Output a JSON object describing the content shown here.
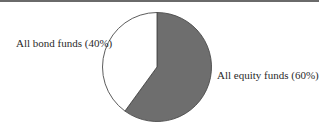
{
  "chart_data": {
    "type": "pie",
    "title": "",
    "categories": [
      "All bond funds",
      "All equity funds"
    ],
    "values": [
      40,
      60
    ],
    "labels": [
      "All bond funds (40%)",
      "All equity funds (60%)"
    ],
    "colors": [
      "#ffffff",
      "#6e6e6e"
    ],
    "start_angle_deg": 90,
    "direction": "clockwise-equity-first",
    "legend": "none (direct labels)"
  }
}
